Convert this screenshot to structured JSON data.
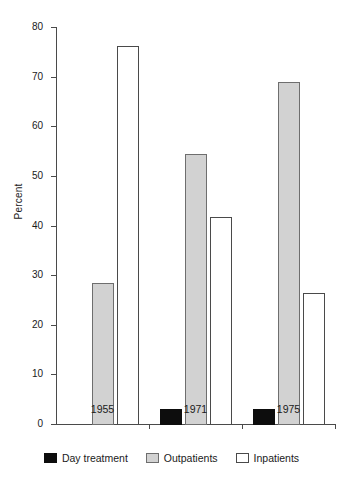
{
  "chart_data": {
    "type": "bar",
    "title": "",
    "xlabel": "",
    "ylabel": "Percent",
    "categories": [
      "1955",
      "1971",
      "1975"
    ],
    "ylim": [
      0,
      80
    ],
    "yticks": [
      0,
      10,
      20,
      30,
      40,
      50,
      60,
      70,
      80
    ],
    "ytick_labels": [
      "0",
      "10",
      "20",
      "30",
      "40",
      "50",
      "60",
      "70",
      "80"
    ],
    "grid": false,
    "legend_position": "bottom",
    "series": [
      {
        "name": "Day treatment",
        "color": "#0d0d0d",
        "values": [
          0,
          3.2,
          3.2
        ]
      },
      {
        "name": "Outpatients",
        "color": "#d2d2d2",
        "values": [
          28.6,
          54.6,
          69.2
        ]
      },
      {
        "name": "Inpatients",
        "color": "#ffffff",
        "values": [
          76.3,
          41.9,
          26.7
        ]
      }
    ]
  },
  "legend": {
    "entries": [
      {
        "label": "Day treatment",
        "swatch": "black-swatch-icon"
      },
      {
        "label": "Outpatients",
        "swatch": "gray-swatch-icon"
      },
      {
        "label": "Inpatients",
        "swatch": "white-swatch-icon"
      }
    ]
  },
  "axis": {
    "y_label": "Percent",
    "y_tick_labels": [
      "80",
      "70",
      "60",
      "50",
      "40",
      "30",
      "20",
      "10",
      "0"
    ],
    "x_tick_labels": [
      "1955",
      "1971",
      "1975"
    ]
  },
  "colors": {
    "day_treatment": "#0d0d0d",
    "outpatients": "#d2d2d2",
    "inpatients": "#ffffff",
    "axis": "#4a4a4a",
    "text": "#1a1a1a",
    "background": "#ffffff"
  }
}
